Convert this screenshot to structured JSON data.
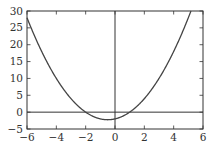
{
  "chart_data": {
    "type": "line",
    "title": "",
    "xlabel": "",
    "ylabel": "",
    "function": "y = x^2 + x - 2",
    "xlim": [
      -6,
      6
    ],
    "ylim": [
      -5,
      30
    ],
    "grid": false,
    "legend": null,
    "xticks": [
      -6,
      -4,
      -2,
      0,
      2,
      4,
      6
    ],
    "yticks": [
      -5,
      0,
      5,
      10,
      15,
      20,
      25,
      30
    ],
    "xtick_labels": [
      "−6",
      "−4",
      "−2",
      "0",
      "2",
      "4",
      "6"
    ],
    "ytick_labels": [
      "−5",
      "0",
      "5",
      "10",
      "15",
      "20",
      "25",
      "30"
    ],
    "reference_lines": [
      {
        "orientation": "horizontal",
        "value": 0
      },
      {
        "orientation": "vertical",
        "value": 0
      }
    ],
    "series": [
      {
        "name": "parabola",
        "color": "#444444",
        "x": [
          -6,
          -5,
          -4,
          -3,
          -2,
          -1,
          -0.5,
          0,
          1,
          2,
          3,
          4,
          5,
          5.17
        ],
        "y": [
          28,
          18,
          10,
          4,
          0,
          -2,
          -2.25,
          -2,
          0,
          4,
          10,
          18,
          28,
          30
        ]
      }
    ],
    "annotations": {
      "vertex": [
        -0.5,
        -2.25
      ],
      "roots": [
        -2,
        1
      ]
    }
  },
  "colors": {
    "axis": "#333333",
    "curve": "#444444",
    "background": "#ffffff"
  }
}
